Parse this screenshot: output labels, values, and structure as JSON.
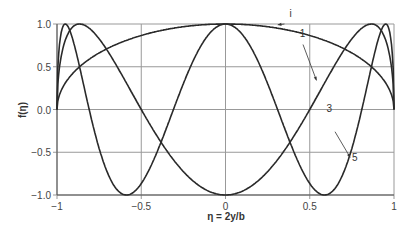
{
  "chart_data": {
    "type": "line",
    "title": "",
    "xlabel": "η = 2y/b",
    "ylabel": "f(η)",
    "xlim": [
      -1,
      1
    ],
    "ylim": [
      -1,
      1
    ],
    "grid": true,
    "x_ticks": [
      "−1",
      "−0.5",
      "0",
      "0.5",
      "1"
    ],
    "y_ticks": [
      "1.0",
      "0.5",
      "0.0",
      "−0.5",
      "−1.0"
    ],
    "series": [
      {
        "name": "1",
        "formula": "sin(1·arccos η)",
        "n": 1,
        "points": [
          [
            -1,
            0
          ],
          [
            -0.5,
            0.87
          ],
          [
            0,
            1
          ],
          [
            0.5,
            0.87
          ],
          [
            1,
            0
          ]
        ]
      },
      {
        "name": "3",
        "formula": "sin(3·arccos η)",
        "n": 3,
        "points": [
          [
            -1,
            0
          ],
          [
            -0.87,
            1
          ],
          [
            -0.5,
            0
          ],
          [
            0,
            -1
          ],
          [
            0.5,
            0
          ],
          [
            0.87,
            1
          ],
          [
            1,
            0
          ]
        ]
      },
      {
        "name": "5",
        "formula": "sin(5·arccos η)",
        "n": 5,
        "points": [
          [
            -1,
            0
          ],
          [
            -0.95,
            1
          ],
          [
            -0.59,
            -1
          ],
          [
            0,
            1
          ],
          [
            0.59,
            -1
          ],
          [
            0.95,
            1
          ],
          [
            1,
            0
          ]
        ]
      }
    ],
    "annotations": [
      {
        "text": "i",
        "x": 0.38,
        "y": 1.08
      },
      {
        "text": "1",
        "x": 0.44,
        "y": 0.85
      },
      {
        "text": "3",
        "x": 0.6,
        "y": -0.03
      },
      {
        "text": "5",
        "x": 0.75,
        "y": -0.6
      }
    ]
  }
}
